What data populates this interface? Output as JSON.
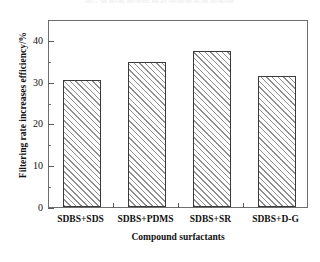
{
  "cut_caption": "图5  复配表面活性剂对滤速增长率的影响",
  "chart_data": {
    "type": "bar",
    "title": "",
    "xlabel": "Compound surfactants",
    "ylabel": "Filtering rate increases efficiency/%",
    "categories": [
      "SDBS+SDS",
      "SDBS+PDMS",
      "SDBS+SR",
      "SDBS+D-G"
    ],
    "values": [
      30.5,
      34.8,
      37.4,
      31.4
    ],
    "ylim": [
      0,
      45
    ],
    "ytick_labels": [
      "0",
      "10",
      "20",
      "30",
      "40"
    ],
    "ytick_values": [
      0,
      10,
      20,
      30,
      40
    ],
    "yminor_values": [
      5,
      15,
      25,
      35,
      45
    ],
    "grid": false,
    "legend": false,
    "bar_fill": "#ffffff",
    "bar_hatch": "forward-diagonal",
    "bar_hatch_color": "#8e8e8e",
    "bar_edge_color": "#3a3a3a",
    "frame_color": "#6e6e6e",
    "background": "#ffffff"
  }
}
